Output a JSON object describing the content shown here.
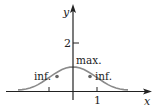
{
  "figure": {
    "type": "function-graph",
    "axes": {
      "x_label": "x",
      "y_label": "y",
      "x_ticks": [
        {
          "value": -1,
          "label": ""
        },
        {
          "value": 1,
          "label": "1"
        }
      ],
      "y_ticks": [
        {
          "value": 2,
          "label": "2"
        }
      ]
    },
    "curve": {
      "description": "bell-shaped curve y = e^(-x^2)",
      "color": "#8a8a8a",
      "x_range": [
        -2.3,
        2.3
      ]
    },
    "annotations": {
      "max_label": "max.",
      "inflection_left_label": "inf.",
      "inflection_right_label": "inf."
    },
    "points": [
      {
        "name": "maximum",
        "x": 0,
        "y": 1
      },
      {
        "name": "inflection-left",
        "x": -0.707,
        "y": 0.607
      },
      {
        "name": "inflection-right",
        "x": 0.707,
        "y": 0.607
      }
    ],
    "colors": {
      "axis": "#222222",
      "curve": "#8a8a8a",
      "point": "#666666"
    }
  }
}
